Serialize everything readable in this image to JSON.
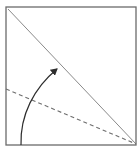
{
  "diagram": {
    "type": "origami-fold-step",
    "colors": {
      "background": "#ffffff",
      "paper_edge": "#6b6b6b",
      "diagonal_crease": "#8a8a8a",
      "valley_fold": "#6e6e6e",
      "arrow": "#2e2e2e"
    },
    "square": {
      "x": 6,
      "y": 7,
      "width": 130,
      "height": 138
    },
    "diagonal_crease": {
      "x1": 8,
      "y1": 9,
      "x2": 136,
      "y2": 144
    },
    "valley_fold_line": {
      "x1": 6,
      "y1": 89,
      "x2": 136,
      "y2": 144,
      "style": "dashed"
    },
    "fold_arrow": {
      "start": [
        21,
        145
      ],
      "end": [
        58,
        68
      ],
      "direction": "up-right"
    }
  }
}
